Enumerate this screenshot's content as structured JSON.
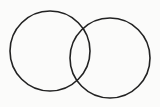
{
  "diagram": {
    "type": "venn",
    "background": "#fbfbfa",
    "stroke_color": "#222222",
    "stroke_width": 1.6,
    "circles": [
      {
        "name": "left-circle",
        "cx": 50,
        "cy": 51,
        "r": 40
      },
      {
        "name": "right-circle",
        "cx": 110,
        "cy": 58,
        "r": 40
      }
    ]
  }
}
